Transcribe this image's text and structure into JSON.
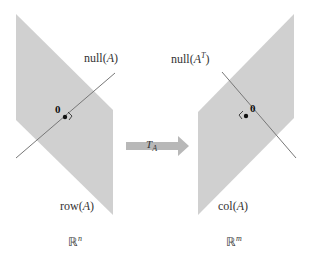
{
  "diagram": {
    "left_space": {
      "subspace_label_prefix": "row(",
      "subspace_label_var": "A",
      "subspace_label_suffix": ")",
      "null_label_prefix": "null(",
      "null_label_var": "A",
      "null_label_suffix": ")",
      "origin_label": "0",
      "space_label": "ℝ",
      "space_exp": "n"
    },
    "right_space": {
      "subspace_label_prefix": "col(",
      "subspace_label_var": "A",
      "subspace_label_suffix": ")",
      "null_label_prefix": "null(",
      "null_label_var": "A",
      "null_label_sup": "T",
      "null_label_suffix": ")",
      "origin_label": "0",
      "space_label": "ℝ",
      "space_exp": "m"
    },
    "transformation": {
      "label": "T",
      "subscript": "A"
    },
    "colors": {
      "region_fill": "#d0d0d0",
      "line": "#777777",
      "arrow": "#b8b8b8"
    }
  }
}
